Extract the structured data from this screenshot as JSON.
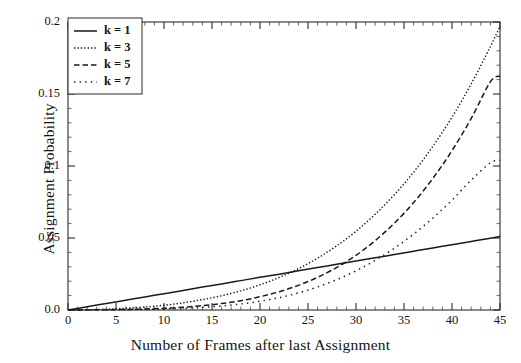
{
  "chart_data": {
    "type": "line",
    "title": "",
    "xlabel": "Number of Frames after last Assignment",
    "ylabel": "Assignment Probability",
    "xlim": [
      0,
      45
    ],
    "ylim": [
      0.0,
      0.2
    ],
    "grid": false,
    "legend_position": "top-left",
    "xticks": [
      "0",
      "5",
      "10",
      "15",
      "20",
      "25",
      "30",
      "35",
      "40",
      "45"
    ],
    "xtick_values": [
      0,
      5,
      10,
      15,
      20,
      25,
      30,
      35,
      40,
      45
    ],
    "yticks": [
      "0.0",
      "0.05",
      "0.1",
      "0.15",
      "0.2"
    ],
    "ytick_values": [
      0.0,
      0.05,
      0.1,
      0.15,
      0.2
    ],
    "x": [
      0,
      2,
      4,
      6,
      8,
      10,
      12,
      14,
      16,
      18,
      20,
      22,
      24,
      26,
      28,
      30,
      32,
      34,
      36,
      38,
      40,
      42,
      44,
      45
    ],
    "series": [
      {
        "name": "k = 1",
        "style": "solid",
        "color": "#1a1a1a",
        "values": [
          0.0,
          0.0023,
          0.0045,
          0.0068,
          0.0091,
          0.0113,
          0.0136,
          0.0159,
          0.0181,
          0.0204,
          0.0227,
          0.0249,
          0.0272,
          0.0295,
          0.0317,
          0.034,
          0.0363,
          0.0385,
          0.0408,
          0.0431,
          0.0453,
          0.0476,
          0.0499,
          0.051
        ]
      },
      {
        "name": "k = 3",
        "style": "dotted-fine",
        "color": "#1a1a1a",
        "values": [
          0.0,
          0.0002,
          0.0006,
          0.0012,
          0.0021,
          0.0033,
          0.005,
          0.0072,
          0.0099,
          0.0133,
          0.0175,
          0.0226,
          0.0287,
          0.036,
          0.0446,
          0.0547,
          0.0665,
          0.0801,
          0.0957,
          0.1136,
          0.1339,
          0.157,
          0.183,
          0.197
        ]
      },
      {
        "name": "k = 5",
        "style": "dashed",
        "color": "#1a1a1a",
        "values": [
          0.0,
          0.0001,
          0.0002,
          0.0004,
          0.0007,
          0.0012,
          0.0019,
          0.003,
          0.0045,
          0.0065,
          0.0092,
          0.0127,
          0.0171,
          0.0227,
          0.0296,
          0.038,
          0.0482,
          0.0603,
          0.0746,
          0.0913,
          0.1107,
          0.133,
          0.1585,
          0.1625
        ]
      },
      {
        "name": "k = 7",
        "style": "dotted-coarse",
        "color": "#1a1a1a",
        "values": [
          0.0,
          5e-05,
          0.0001,
          0.0002,
          0.0004,
          0.0007,
          0.0011,
          0.0018,
          0.0028,
          0.0042,
          0.0061,
          0.0086,
          0.0119,
          0.016,
          0.0211,
          0.0272,
          0.0345,
          0.0429,
          0.0527,
          0.0638,
          0.0763,
          0.0902,
          0.1022,
          0.104
        ]
      }
    ]
  },
  "legend": {
    "entries": [
      {
        "label": "k = 1"
      },
      {
        "label": "k = 3"
      },
      {
        "label": "k = 5"
      },
      {
        "label": "k = 7"
      }
    ]
  }
}
